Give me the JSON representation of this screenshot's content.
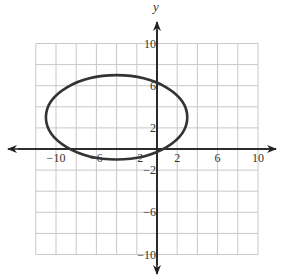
{
  "chart_data": {
    "type": "line",
    "title": "",
    "xlabel": "",
    "ylabel": "y",
    "xlim": [
      -12,
      10
    ],
    "ylim": [
      -10,
      10
    ],
    "grid": true,
    "grid_spacing": 2,
    "x_tick_labels": [
      "-10",
      "-6",
      "-2",
      "2",
      "6",
      "10"
    ],
    "y_tick_labels": [
      "10",
      "6",
      "2",
      "-2",
      "-6",
      "-10"
    ],
    "series": [
      {
        "name": "ellipse",
        "shape": "ellipse",
        "center": [
          -4,
          3
        ],
        "semi_axis_x": 7,
        "semi_axis_y": 4,
        "color": "#333333"
      }
    ],
    "legend": null
  },
  "colors": {
    "grid": "#c8c8c8",
    "axis": "#222222",
    "curve": "#333333"
  }
}
